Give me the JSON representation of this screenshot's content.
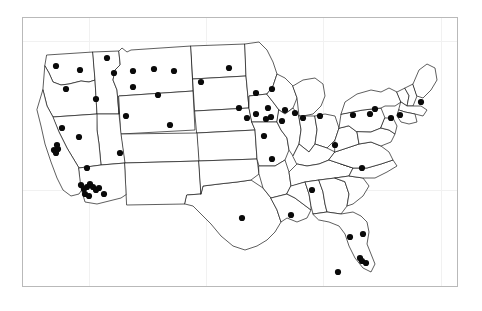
{
  "figure": {
    "title": "",
    "width": 482,
    "height": 311,
    "background_color": "#ffffff",
    "frame_color": "#b9b9b9",
    "gridline_color": "#f1f1f1",
    "outline_color": "#1a1a1a",
    "point_color": "#0a0a0a"
  },
  "chart_data": {
    "type": "scatter",
    "title": "",
    "subtitle": "",
    "xlabel": "",
    "ylabel": "",
    "projection": "contiguous-united-states",
    "grid": true,
    "legend": "none",
    "xlim": [
      0,
      436
    ],
    "ylim": [
      0,
      270
    ],
    "xticks": [],
    "yticks": [],
    "gridlines_v": [
      66,
      183,
      300,
      418
    ],
    "gridlines_h": [
      23,
      172
    ],
    "marker_shape": "circle",
    "marker_size": 3.1,
    "n_points": 61,
    "series": [
      {
        "name": "locations",
        "color": "#0a0a0a",
        "points": [
          [
            33,
            48
          ],
          [
            57,
            52
          ],
          [
            84,
            40
          ],
          [
            91,
            55
          ],
          [
            43,
            71
          ],
          [
            73,
            81
          ],
          [
            110,
            53
          ],
          [
            110,
            69
          ],
          [
            131,
            51
          ],
          [
            151,
            53
          ],
          [
            135,
            77
          ],
          [
            178,
            64
          ],
          [
            103,
            98
          ],
          [
            147,
            107
          ],
          [
            39,
            110
          ],
          [
            34,
            127
          ],
          [
            31,
            132
          ],
          [
            33,
            135
          ],
          [
            35,
            131
          ],
          [
            56,
            119
          ],
          [
            64,
            150
          ],
          [
            58,
            167
          ],
          [
            61,
            171
          ],
          [
            64,
            169
          ],
          [
            67,
            166
          ],
          [
            70,
            169
          ],
          [
            73,
            172
          ],
          [
            76,
            170
          ],
          [
            62,
            176
          ],
          [
            66,
            178
          ],
          [
            81,
            176
          ],
          [
            97,
            135
          ],
          [
            206,
            50
          ],
          [
            233,
            75
          ],
          [
            249,
            71
          ],
          [
            216,
            90
          ],
          [
            245,
            90
          ],
          [
            262,
            92
          ],
          [
            233,
            96
          ],
          [
            248,
            99
          ],
          [
            272,
            95
          ],
          [
            224,
            100
          ],
          [
            243,
            101
          ],
          [
            259,
            103
          ],
          [
            280,
            100
          ],
          [
            241,
            118
          ],
          [
            297,
            98
          ],
          [
            249,
            141
          ],
          [
            219,
            200
          ],
          [
            268,
            197
          ],
          [
            289,
            172
          ],
          [
            330,
            97
          ],
          [
            347,
            96
          ],
          [
            352,
            91
          ],
          [
            368,
            100
          ],
          [
            398,
            84
          ],
          [
            377,
            97
          ],
          [
            312,
            127
          ],
          [
            339,
            150
          ],
          [
            327,
            219
          ],
          [
            340,
            216
          ],
          [
            337,
            240
          ],
          [
            339,
            243
          ],
          [
            343,
            245
          ],
          [
            315,
            254
          ]
        ]
      }
    ]
  },
  "map": {
    "region_name": "Contiguous United States",
    "boundary_type": "state-outlines"
  }
}
